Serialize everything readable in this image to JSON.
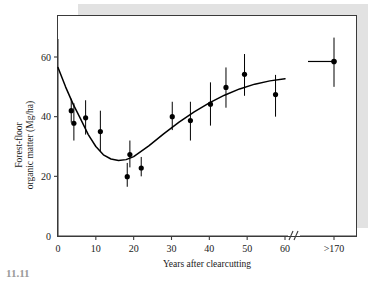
{
  "chart_data": {
    "type": "scatter",
    "title": "",
    "xlabel": "Years after clearcutting",
    "ylabel": "Forest-floor organic matter (Mg/ha)",
    "xlim": [
      0,
      62
    ],
    "ylim": [
      0,
      68
    ],
    "grid": false,
    "legend": null,
    "axis_break": {
      "present": true,
      "after_tick": 60,
      "symbol": "//"
    },
    "x_ticks": [
      {
        "value": 0,
        "label": "0"
      },
      {
        "value": 10,
        "label": "10"
      },
      {
        "value": 20,
        "label": "20"
      },
      {
        "value": 30,
        "label": "30"
      },
      {
        "value": 40,
        "label": "40"
      },
      {
        "value": 50,
        "label": "50"
      },
      {
        "value": 60,
        "label": "60"
      }
    ],
    "x_ticks_after_break": [
      {
        "label": ">170"
      }
    ],
    "y_ticks": [
      {
        "value": 0,
        "label": "0"
      },
      {
        "value": 20,
        "label": "20"
      },
      {
        "value": 40,
        "label": "40"
      },
      {
        "value": 60,
        "label": "60"
      }
    ],
    "points": [
      {
        "x": 3.5,
        "y": 42.0,
        "err_low": 38.0,
        "err_high": 46.0
      },
      {
        "x": 4.2,
        "y": 37.8,
        "err_low": 32.0,
        "err_high": 44.5
      },
      {
        "x": 7.3,
        "y": 39.6,
        "err_low": 34.0,
        "err_high": 45.5
      },
      {
        "x": 11.2,
        "y": 35.0,
        "err_low": 28.5,
        "err_high": 42.0
      },
      {
        "x": 18.3,
        "y": 19.9,
        "err_low": 16.5,
        "err_high": 24.5
      },
      {
        "x": 19.0,
        "y": 27.3,
        "err_low": 23.0,
        "err_high": 32.0
      },
      {
        "x": 22.0,
        "y": 22.8,
        "err_low": 20.0,
        "err_high": 26.5
      },
      {
        "x": 30.2,
        "y": 40.0,
        "err_low": 35.5,
        "err_high": 45.0
      },
      {
        "x": 35.0,
        "y": 38.7,
        "err_low": 32.0,
        "err_high": 45.0
      },
      {
        "x": 40.3,
        "y": 44.2,
        "err_low": 37.0,
        "err_high": 51.5
      },
      {
        "x": 44.4,
        "y": 49.8,
        "err_low": 43.0,
        "err_high": 56.5
      },
      {
        "x": 49.3,
        "y": 54.2,
        "err_low": 47.0,
        "err_high": 61.0
      },
      {
        "x": 57.5,
        "y": 47.4,
        "err_low": 40.0,
        "err_high": 54.0
      }
    ],
    "point_after_break": {
      "label": ">170",
      "y": 58.5,
      "err_low": 50.0,
      "err_high": 66.5,
      "has_horizontal_range_bar": true
    },
    "fitted_curve": {
      "description": "U-shaped fitted trend line",
      "x": [
        0,
        2,
        4,
        6,
        8,
        10,
        12,
        14,
        16,
        18,
        20,
        24,
        28,
        32,
        36,
        40,
        44,
        48,
        52,
        56,
        60
      ],
      "y": [
        56.5,
        50.0,
        44.2,
        39.2,
        34.0,
        30.0,
        27.2,
        25.8,
        25.3,
        25.6,
        26.6,
        30.2,
        34.3,
        38.2,
        41.6,
        44.6,
        47.2,
        49.3,
        50.9,
        52.0,
        52.7
      ]
    },
    "colors": {
      "point": "#000000",
      "curve": "#000000",
      "frame": "#3a3a3a",
      "shadow": "#e2e2e2",
      "background": "#ffffff"
    }
  },
  "caption": {
    "partial_text": "11.11"
  }
}
